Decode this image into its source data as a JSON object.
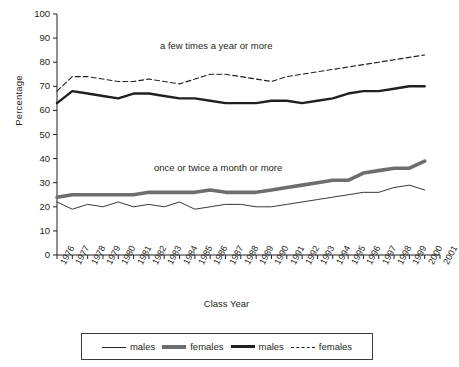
{
  "chart_data": {
    "type": "line",
    "title": "",
    "xlabel": "Class Year",
    "ylabel": "Percentage",
    "ylim": [
      0,
      100
    ],
    "ytick_step": 10,
    "yticks": [
      0,
      10,
      20,
      30,
      40,
      50,
      60,
      70,
      80,
      90,
      100
    ],
    "grid": false,
    "legend_position": "bottom",
    "categories": [
      1976,
      1977,
      1978,
      1979,
      1980,
      1981,
      1982,
      1983,
      1984,
      1985,
      1986,
      1987,
      1988,
      1989,
      1990,
      1991,
      1992,
      1993,
      1994,
      1995,
      1996,
      1997,
      1998,
      1999,
      2000
    ],
    "xtick_labels": [
      "1976",
      "1977",
      "1978",
      "1979",
      "1980",
      "1981",
      "1982",
      "1983",
      "1984",
      "1985",
      "1986",
      "1987",
      "1988",
      "1989",
      "1990",
      "1991",
      "1992",
      "1993",
      "1994",
      "1995",
      "1996",
      "1997",
      "1998",
      "1999",
      "2000",
      "2001"
    ],
    "annotations": [
      {
        "text": "a few times a year or more",
        "x": 1984,
        "y": 85
      },
      {
        "text": "once or twice a month or more",
        "x": 1984,
        "y": 38
      }
    ],
    "series": [
      {
        "name": "males",
        "group": "once or twice a month or more",
        "style": "thin-solid",
        "color": "#231f20",
        "values": [
          22,
          19,
          21,
          20,
          22,
          20,
          21,
          20,
          22,
          19,
          20,
          21,
          21,
          20,
          20,
          21,
          22,
          23,
          24,
          25,
          26,
          26,
          28,
          29,
          27
        ]
      },
      {
        "name": "females",
        "group": "once or twice a month or more",
        "style": "thick-gray",
        "color": "#6d6e70",
        "values": [
          24,
          25,
          25,
          25,
          25,
          25,
          26,
          26,
          26,
          26,
          27,
          26,
          26,
          26,
          27,
          28,
          29,
          30,
          31,
          31,
          34,
          35,
          36,
          36,
          39
        ]
      },
      {
        "name": "males",
        "group": "a few times a year or more",
        "style": "thick-black",
        "color": "#231f20",
        "values": [
          63,
          68,
          67,
          66,
          65,
          67,
          67,
          66,
          65,
          65,
          64,
          63,
          63,
          63,
          64,
          64,
          63,
          64,
          65,
          67,
          68,
          68,
          69,
          70,
          70
        ]
      },
      {
        "name": "females",
        "group": "a few times a year or more",
        "style": "dashed",
        "color": "#231f20",
        "values": [
          68,
          74,
          74,
          73,
          72,
          72,
          73,
          72,
          71,
          73,
          75,
          75,
          74,
          73,
          72,
          74,
          75,
          76,
          77,
          78,
          79,
          80,
          81,
          82,
          83
        ]
      }
    ]
  },
  "legend": {
    "items": [
      {
        "label": "males",
        "style": "thin-solid"
      },
      {
        "label": "females",
        "style": "thick-gray"
      },
      {
        "label": "males",
        "style": "thick-black"
      },
      {
        "label": "females",
        "style": "dashed"
      }
    ]
  }
}
